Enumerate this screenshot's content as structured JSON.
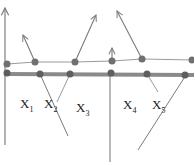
{
  "colors": {
    "background": "#ffffff",
    "line": "#7a7a7a",
    "thick_line": "#8a8a8a",
    "dot": "#6e6e6e",
    "text": "#222222"
  },
  "labels": [
    {
      "main": "X",
      "sub": "1"
    },
    {
      "main": "X",
      "sub": "2"
    },
    {
      "main": "X",
      "sub": "3"
    },
    {
      "main": "X",
      "sub": "4"
    },
    {
      "main": "X",
      "sub": "5"
    }
  ]
}
